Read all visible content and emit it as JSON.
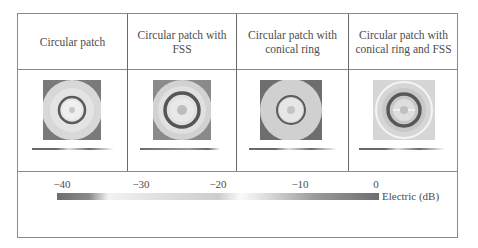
{
  "table": {
    "columns": [
      {
        "label": "Circular patch",
        "pattern": "circular-patch"
      },
      {
        "label": "Circular patch with FSS",
        "pattern": "circular-patch-fss"
      },
      {
        "label": "Circular patch with conical ring",
        "pattern": "circular-patch-conical-ring"
      },
      {
        "label": "Circular patch with conical ring and FSS",
        "pattern": "circular-patch-conical-ring-fss"
      }
    ]
  },
  "colorbar": {
    "ticks": [
      "−40",
      "−30",
      "−20",
      "−10",
      "0"
    ],
    "tick_values": [
      -40,
      -30,
      -20,
      -10,
      0
    ],
    "label": "Electric (dB)"
  }
}
